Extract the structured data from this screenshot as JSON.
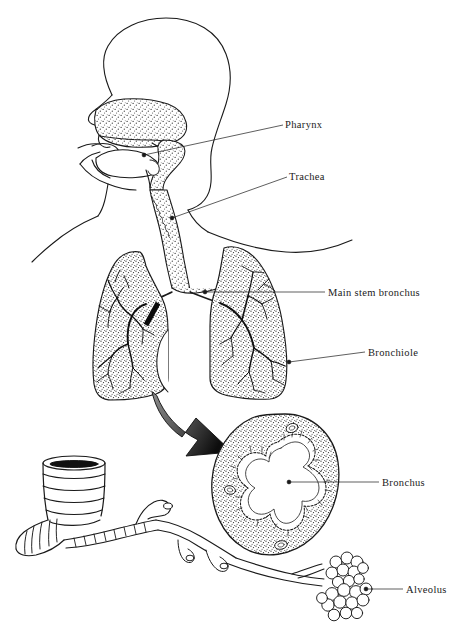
{
  "figure": {
    "background_color": "#ffffff",
    "ink_color": "#1a1a1a",
    "width": 464,
    "height": 632
  },
  "labels": [
    {
      "id": "pharynx",
      "text": "Pharynx",
      "text_x": 285,
      "text_y": 128,
      "leader": {
        "x1": 283,
        "y1": 125,
        "x2": 144,
        "y2": 155
      },
      "dot": {
        "x": 144,
        "y": 155
      }
    },
    {
      "id": "trachea",
      "text": "Trachea",
      "text_x": 289,
      "text_y": 180,
      "leader": {
        "x1": 287,
        "y1": 177,
        "x2": 172,
        "y2": 218
      },
      "dot": {
        "x": 172,
        "y": 218
      }
    },
    {
      "id": "main-stem-bronchus",
      "text": "Main stem bronchus",
      "text_x": 328,
      "text_y": 296,
      "leader": {
        "x1": 325,
        "y1": 292,
        "x2": 205,
        "y2": 292
      },
      "dot": {
        "x": 205,
        "y": 292
      }
    },
    {
      "id": "bronchiole",
      "text": "Bronchiole",
      "text_x": 368,
      "text_y": 356,
      "leader": {
        "x1": 365,
        "y1": 352,
        "x2": 289,
        "y2": 362
      },
      "dot": {
        "x": 289,
        "y": 362
      }
    },
    {
      "id": "bronchus",
      "text": "Bronchus",
      "text_x": 382,
      "text_y": 486,
      "leader": {
        "x1": 379,
        "y1": 482,
        "x2": 289,
        "y2": 482
      },
      "dot": {
        "x": 289,
        "y": 482
      }
    },
    {
      "id": "alveolus",
      "text": "Alveolus",
      "text_x": 406,
      "text_y": 593,
      "leader": {
        "x1": 403,
        "y1": 589,
        "x2": 366,
        "y2": 589
      },
      "dot": {
        "x": 366,
        "y": 589
      }
    }
  ],
  "parts": {
    "head": "head-profile-outline",
    "nasal_cavity": "nasal-cavity-stippled",
    "oral_cavity": "oral-cavity-tongue-palate",
    "epiglottis": "epiglottis",
    "trachea_tube": "trachea-stippled-tube",
    "left_lung": "left-lung-stippled",
    "right_lung": "right-lung-stippled",
    "bronchial_tree_left": "bronchial-tree-left",
    "bronchial_tree_right": "bronchial-tree-right",
    "marker_bar": "main-stem-bronchus-marker-bar",
    "arrow": "magnification-arrow",
    "bronchus_cross_section": "bronchus-cross-section-circle",
    "cartilage_rings": "tracheal-cartilage-rings-inset",
    "bronchiole_branch": "bronchiole-branching-inset",
    "alveoli_clusters": "alveoli-grape-clusters",
    "torso": "torso-shoulder-outline"
  }
}
